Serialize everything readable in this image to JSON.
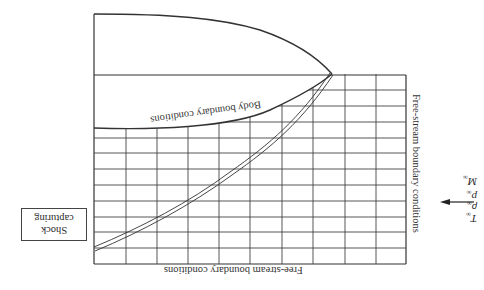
{
  "diagram": {
    "title": "",
    "orientation": "rotated-180",
    "labels": {
      "body_boundary": "Body boundary conditions",
      "freestream_right": "Free-stream boundary conditions",
      "freestream_bottom": "Free-stream boundary conditions",
      "shock_capturing_line1": "Shock",
      "shock_capturing_line2": "capturing"
    },
    "freestream_inputs": {
      "arrow": "left-arrow",
      "variables": [
        {
          "symbol": "M",
          "subscript": "∞"
        },
        {
          "symbol": "p",
          "subscript": "∞"
        },
        {
          "symbol": "ρ",
          "subscript": "∞"
        },
        {
          "symbol": "T",
          "subscript": "∞"
        }
      ]
    },
    "grid": {
      "columns": 10,
      "rows": 12,
      "vertical_lines_x": [
        94,
        126,
        157,
        188,
        219,
        250,
        282,
        313,
        345,
        376,
        406
      ],
      "horizontal_lines_y": [
        75,
        90,
        106,
        122,
        138,
        153,
        169,
        185,
        201,
        217,
        232,
        248,
        264
      ]
    },
    "colors": {
      "line": "#333333",
      "background": "#ffffff"
    }
  }
}
